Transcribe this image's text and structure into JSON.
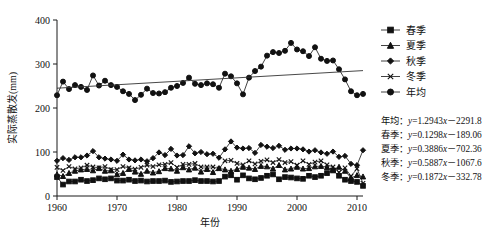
{
  "chart_data": {
    "type": "line",
    "title": "",
    "xlabel": "年份",
    "ylabel": "实际蒸散发(mm)",
    "xlim": [
      1960,
      2011
    ],
    "ylim": [
      0,
      400
    ],
    "xticks": [
      1960,
      1970,
      1980,
      1990,
      2000,
      2010
    ],
    "yticks": [
      0,
      100,
      200,
      300,
      400
    ],
    "grid": false,
    "legend_position": "right-top",
    "x": [
      1960,
      1961,
      1962,
      1963,
      1964,
      1965,
      1966,
      1967,
      1968,
      1969,
      1970,
      1971,
      1972,
      1973,
      1974,
      1975,
      1976,
      1977,
      1978,
      1979,
      1980,
      1981,
      1982,
      1983,
      1984,
      1985,
      1986,
      1987,
      1988,
      1989,
      1990,
      1991,
      1992,
      1993,
      1994,
      1995,
      1996,
      1997,
      1998,
      1999,
      2000,
      2001,
      2002,
      2003,
      2004,
      2005,
      2006,
      2007,
      2008,
      2009,
      2010,
      2011
    ],
    "series": [
      {
        "name": "春季",
        "marker": "square",
        "values": [
          43,
          26,
          33,
          33,
          37,
          34,
          36,
          40,
          38,
          40,
          35,
          35,
          37,
          34,
          35,
          33,
          34,
          34,
          35,
          32,
          33,
          34,
          34,
          36,
          34,
          34,
          33,
          34,
          44,
          47,
          37,
          47,
          40,
          38,
          41,
          46,
          49,
          38,
          43,
          42,
          40,
          39,
          46,
          43,
          46,
          52,
          58,
          46,
          37,
          34,
          32,
          23
        ]
      },
      {
        "name": "夏季",
        "marker": "triangle",
        "values": [
          49,
          45,
          52,
          57,
          60,
          61,
          58,
          63,
          57,
          58,
          49,
          52,
          61,
          55,
          50,
          57,
          53,
          56,
          63,
          62,
          57,
          65,
          60,
          64,
          55,
          61,
          54,
          63,
          60,
          57,
          61,
          66,
          64,
          61,
          68,
          67,
          62,
          70,
          60,
          62,
          66,
          62,
          63,
          67,
          68,
          65,
          60,
          66,
          57,
          41,
          47,
          44
        ]
      },
      {
        "name": "秋季",
        "marker": "diamond",
        "values": [
          80,
          86,
          82,
          88,
          88,
          92,
          102,
          88,
          85,
          83,
          80,
          94,
          83,
          81,
          83,
          79,
          86,
          99,
          93,
          107,
          92,
          93,
          113,
          97,
          100,
          95,
          96,
          87,
          106,
          124,
          110,
          108,
          109,
          98,
          116,
          112,
          109,
          114,
          105,
          108,
          108,
          106,
          101,
          104,
          99,
          96,
          101,
          89,
          91,
          73,
          70,
          104
        ]
      },
      {
        "name": "冬季",
        "marker": "x",
        "values": [
          65,
          58,
          67,
          62,
          64,
          70,
          66,
          64,
          67,
          60,
          60,
          67,
          64,
          61,
          65,
          70,
          67,
          71,
          72,
          76,
          65,
          72,
          72,
          74,
          66,
          66,
          66,
          62,
          80,
          81,
          74,
          71,
          80,
          73,
          79,
          82,
          76,
          83,
          76,
          78,
          70,
          80,
          72,
          77,
          80,
          71,
          66,
          54,
          64,
          45,
          62,
          29
        ]
      },
      {
        "name": "年均",
        "marker": "circle",
        "values": [
          229,
          260,
          243,
          252,
          248,
          241,
          274,
          251,
          262,
          252,
          248,
          238,
          232,
          218,
          230,
          244,
          234,
          233,
          236,
          246,
          250,
          257,
          269,
          255,
          252,
          256,
          254,
          246,
          278,
          272,
          256,
          231,
          269,
          284,
          294,
          319,
          327,
          325,
          330,
          348,
          333,
          329,
          318,
          338,
          312,
          307,
          308,
          288,
          265,
          238,
          229,
          232
        ]
      }
    ],
    "trendline": {
      "name": "年均趋势线",
      "x": [
        1960,
        2011
      ],
      "y": [
        245,
        285
      ]
    }
  },
  "legend": {
    "items": [
      {
        "label": "春季",
        "marker": "square"
      },
      {
        "label": "夏季",
        "marker": "triangle"
      },
      {
        "label": "秋季",
        "marker": "diamond"
      },
      {
        "label": "冬季",
        "marker": "x"
      },
      {
        "label": "年均",
        "marker": "circle"
      }
    ]
  },
  "equations": [
    {
      "series": "年均",
      "sep": "：",
      "lhs": "y",
      "eq": "=",
      "body": "1.2943x－2291.8",
      "full": "年均：y=1.2943x－2291.8"
    },
    {
      "series": "春季",
      "sep": "：",
      "lhs": "y",
      "eq": "=",
      "body": "0.1298x－189.06",
      "full": "春季：y=0.1298x－189.06"
    },
    {
      "series": "夏季",
      "sep": "：",
      "lhs": "y",
      "eq": "=",
      "body": "0.3886x－702.36",
      "full": "夏季：y=0.3886x－702.36"
    },
    {
      "series": "秋季",
      "sep": "：",
      "lhs": "y",
      "eq": "=",
      "body": "0.5887x－1067.6",
      "full": "秋季：y=0.5887x－1067.6"
    },
    {
      "series": "冬季",
      "sep": "：",
      "lhs": "y",
      "eq": "=",
      "body": "0.1872x－332.78",
      "full": "冬季：y=0.1872x－332.78"
    }
  ],
  "colors": {
    "ink": "#111111",
    "background": "#ffffff"
  }
}
